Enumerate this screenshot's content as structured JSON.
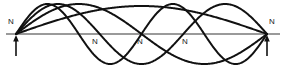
{
  "figure": {
    "name": "standing-wave-harmonics-diagram",
    "background_color": "#ffffff",
    "axis_color": "#9a9a9a",
    "curve_color": "#111111",
    "label_color": "#1a1a1a"
  },
  "axis": {
    "label": "equilibrium-axis",
    "y": 34,
    "x_start": 6,
    "x_end": 280,
    "stroke_width": 2.2
  },
  "string_endpoints": {
    "left_x": 16,
    "right_x": 267
  },
  "supports": [
    {
      "name": "left-support-arrow",
      "x": 16,
      "tail_y": 56,
      "head_y": 36
    },
    {
      "name": "right-support-arrow",
      "x": 267,
      "tail_y": 56,
      "head_y": 36
    }
  ],
  "labels": [
    {
      "id": "node-left-end",
      "text": "N",
      "x": 8,
      "y": 18
    },
    {
      "id": "node-interior-1",
      "text": "N",
      "x": 92,
      "y": 38
    },
    {
      "id": "node-interior-2",
      "text": "N",
      "x": 137,
      "y": 38
    },
    {
      "id": "node-interior-3",
      "text": "N",
      "x": 182,
      "y": 38
    },
    {
      "id": "node-right-end",
      "text": "N",
      "x": 269,
      "y": 18
    }
  ],
  "chart_data": {
    "type": "line",
    "title": "",
    "subtitle": "",
    "xlabel": "",
    "ylabel": "",
    "grid": false,
    "legend_position": "none",
    "annotations": [
      {
        "text": "N",
        "meaning": "node",
        "position": "left fixed end"
      },
      {
        "text": "N",
        "meaning": "node",
        "position": "interior at x = 92"
      },
      {
        "text": "N",
        "meaning": "node",
        "position": "interior at x = 137"
      },
      {
        "text": "N",
        "meaning": "node",
        "position": "interior at x = 182"
      },
      {
        "text": "N",
        "meaning": "node",
        "position": "right fixed end"
      }
    ],
    "x_domain_px": [
      16,
      267
    ],
    "axis_y_px": 34,
    "series": [
      {
        "name": "harmonic-1",
        "harmonic": 1,
        "half_wavelengths": 1,
        "amplitude_px": 28,
        "phase_sign": 1,
        "stroke_width": 2.0,
        "description": "fundamental, single arch above the axis"
      },
      {
        "name": "harmonic-2",
        "harmonic": 2,
        "half_wavelengths": 2,
        "amplitude_px": 30,
        "phase_sign": 1,
        "stroke_width": 2.0,
        "description": "second harmonic, crest then trough, one interior node"
      },
      {
        "name": "harmonic-3",
        "harmonic": 3,
        "half_wavelengths": 3,
        "amplitude_px": 30,
        "phase_sign": 1,
        "stroke_width": 2.0,
        "description": "third harmonic, two interior nodes"
      },
      {
        "name": "harmonic-4",
        "harmonic": 4,
        "half_wavelengths": 4,
        "amplitude_px": 30,
        "phase_sign": 1,
        "stroke_width": 2.0,
        "description": "fourth harmonic, three interior nodes"
      }
    ]
  }
}
